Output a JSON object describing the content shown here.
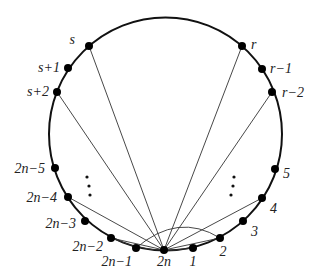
{
  "diagram": {
    "type": "circle-graph",
    "circle": {
      "cx": 165.5,
      "cy": 134,
      "r": 116.5,
      "stroke": "#111111"
    },
    "nodes": [
      {
        "id": "s",
        "label": "s",
        "x": 89,
        "y": 46,
        "lx": 75,
        "ly": 44,
        "anchor": "end"
      },
      {
        "id": "s+1",
        "label": "s+1",
        "x": 68,
        "y": 68,
        "lx": 60,
        "ly": 72,
        "anchor": "end"
      },
      {
        "id": "s+2",
        "label": "s+2",
        "x": 57,
        "y": 92,
        "lx": 49,
        "ly": 96,
        "anchor": "end"
      },
      {
        "id": "r",
        "label": "r",
        "x": 242,
        "y": 46,
        "lx": 251,
        "ly": 49,
        "anchor": "start"
      },
      {
        "id": "r-1",
        "label": "r−1",
        "x": 262,
        "y": 69,
        "lx": 270,
        "ly": 73,
        "anchor": "start"
      },
      {
        "id": "r-2",
        "label": "r−2",
        "x": 272,
        "y": 92,
        "lx": 282,
        "ly": 97,
        "anchor": "start"
      },
      {
        "id": "2n-5",
        "label": "2n−5",
        "x": 55,
        "y": 168,
        "lx": 45,
        "ly": 173,
        "anchor": "end"
      },
      {
        "id": "2n-4",
        "label": "2n−4",
        "x": 68,
        "y": 197,
        "lx": 57,
        "ly": 202,
        "anchor": "end"
      },
      {
        "id": "2n-3",
        "label": "2n−3",
        "x": 85,
        "y": 221,
        "lx": 76,
        "ly": 228,
        "anchor": "end"
      },
      {
        "id": "2n-2",
        "label": "2n−2",
        "x": 111,
        "y": 238,
        "lx": 103,
        "ly": 251,
        "anchor": "end"
      },
      {
        "id": "2n-1",
        "label": "2n−1",
        "x": 136,
        "y": 248,
        "lx": 132,
        "ly": 266,
        "anchor": "end"
      },
      {
        "id": "2n",
        "label": "2n",
        "x": 164,
        "y": 250,
        "lx": 164,
        "ly": 266,
        "anchor": "middle"
      },
      {
        "id": "1",
        "label": "1",
        "x": 193,
        "y": 248,
        "lx": 193,
        "ly": 266,
        "anchor": "middle"
      },
      {
        "id": "2",
        "label": "2",
        "x": 220,
        "y": 238,
        "lx": 223,
        "ly": 256,
        "anchor": "middle"
      },
      {
        "id": "3",
        "label": "3",
        "x": 243,
        "y": 221,
        "lx": 251,
        "ly": 236,
        "anchor": "start"
      },
      {
        "id": "4",
        "label": "4",
        "x": 262,
        "y": 198,
        "lx": 270,
        "ly": 213,
        "anchor": "start"
      },
      {
        "id": "5",
        "label": "5",
        "x": 275,
        "y": 169,
        "lx": 283,
        "ly": 178,
        "anchor": "start"
      }
    ],
    "edges": [
      {
        "from": "2n",
        "to": "s"
      },
      {
        "from": "2n",
        "to": "s+2"
      },
      {
        "from": "2n",
        "to": "r"
      },
      {
        "from": "2n",
        "to": "r-2"
      },
      {
        "from": "2n",
        "to": "2n-4"
      },
      {
        "from": "2n",
        "to": "4"
      },
      {
        "from": "2n",
        "to": "2n-2"
      },
      {
        "from": "2n",
        "to": "2"
      },
      {
        "from": "2n-2",
        "to": "1",
        "curve": "M111,238 Q152,256 193,248"
      },
      {
        "from": "2n-1",
        "to": "2",
        "curve": "M136,248 Q178,212 220,238"
      }
    ],
    "ellipses": [
      {
        "id": "left-dots",
        "dots": [
          [
            87,
            177
          ],
          [
            89,
            186
          ],
          [
            90,
            195
          ]
        ]
      },
      {
        "id": "right-dots",
        "dots": [
          [
            234,
            177
          ],
          [
            233,
            186
          ],
          [
            231,
            195
          ]
        ]
      }
    ]
  }
}
